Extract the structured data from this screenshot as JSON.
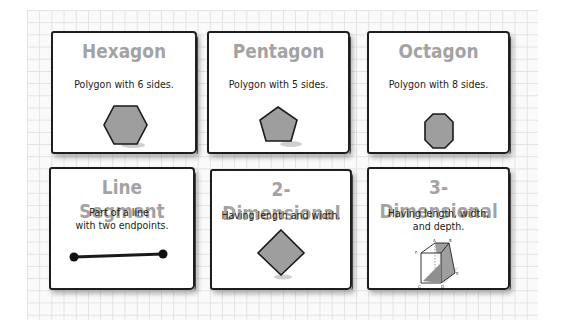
{
  "cards": [
    {
      "title": "Hexagon",
      "description": "Polygon with 6 sides.",
      "shape": "hexagon-icon"
    },
    {
      "title": "Pentagon",
      "description": "Polygon with 5 sides.",
      "shape": "pentagon-icon"
    },
    {
      "title": "Octagon",
      "description": "Polygon with 8 sides.",
      "shape": "octagon-icon"
    },
    {
      "title": "Line Segment",
      "description_line1": "Part of a line",
      "description_line2": "with two endpoints.",
      "shape": "line-segment-icon"
    },
    {
      "title": "2-Dimensional",
      "description": "Having length and width.",
      "shape": "diamond-square-icon"
    },
    {
      "title": "3-Dimensional",
      "description_line1": "Having length, width,",
      "description_line2": "and depth.",
      "shape": "cube-icon",
      "cube_labels": [
        "A",
        "B",
        "C",
        "D",
        "E",
        "F",
        "G"
      ]
    }
  ],
  "colors": {
    "title": "#a3a3a3",
    "shape_fill": "#9e9e9e",
    "border": "#1e1e1e",
    "grid_line": "#e2e2e2"
  }
}
